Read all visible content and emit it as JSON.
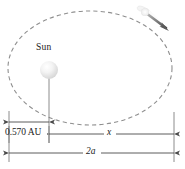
{
  "figure": {
    "background_color": "#ffffff",
    "orbit": {
      "shape": "ellipse",
      "style": "dashed",
      "color": "#8c8c8c",
      "center_x": 90,
      "center_y": 68,
      "radius_x": 82,
      "radius_y": 57
    },
    "sun": {
      "label": "Sun",
      "color": "#e8e8e8",
      "center_x": 49,
      "center_y": 70,
      "radius": 9
    },
    "comet": {
      "label": "comet",
      "head_color": "#f2f2f2",
      "tail_color": "#6b6b6b",
      "head_x": 147,
      "head_y": 13,
      "arrow_tip_x": 168,
      "arrow_tip_y": 30
    },
    "dimensions": [
      {
        "name": "perihelion-distance",
        "label": "0.570 AU",
        "from_x": 9,
        "to_x": 49,
        "y": 122
      },
      {
        "name": "remaining-axis-distance",
        "label": "x",
        "from_x": 49,
        "to_x": 174,
        "y": 134
      },
      {
        "name": "major-axis",
        "label": "2a",
        "from_x": 9,
        "to_x": 174,
        "y": 153
      }
    ],
    "line_color": "#555555"
  }
}
